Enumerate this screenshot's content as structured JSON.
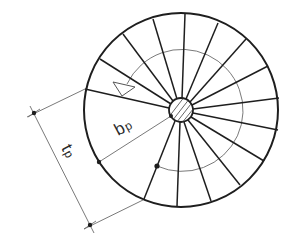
{
  "diagram": {
    "type": "spiral staircase plan",
    "colors": {
      "background": "#ffffff",
      "line": "#1e1e1e",
      "thin_line": "#6a6a6a"
    },
    "center": [
      181,
      110
    ],
    "outer_radius": 97,
    "walking_line_radius": 61,
    "hub_radius": 12,
    "tread_spokes_outer_points": [
      [
        85,
        89
      ],
      [
        100,
        59
      ],
      [
        123,
        34
      ],
      [
        153,
        19
      ],
      [
        185,
        14
      ],
      [
        218,
        23
      ],
      [
        246,
        39
      ],
      [
        268,
        66
      ],
      [
        279,
        98
      ],
      [
        278,
        130
      ],
      [
        264,
        161
      ],
      [
        240,
        185
      ],
      [
        211,
        201
      ],
      [
        177,
        206
      ],
      [
        144,
        199
      ]
    ],
    "labels": {
      "going_width": {
        "main": "b",
        "sub": "p"
      },
      "tread_going": {
        "main": "t",
        "sub": "p"
      }
    },
    "dimension_points": {
      "tp_start": [
        34,
        113
      ],
      "tp_end": [
        90,
        225
      ],
      "bp_outer_dot": [
        99,
        162
      ],
      "walking_line_dot": [
        157,
        166
      ],
      "hub_dot": [
        171,
        116
      ]
    },
    "direction_arrow": "walking-line-arrow"
  }
}
